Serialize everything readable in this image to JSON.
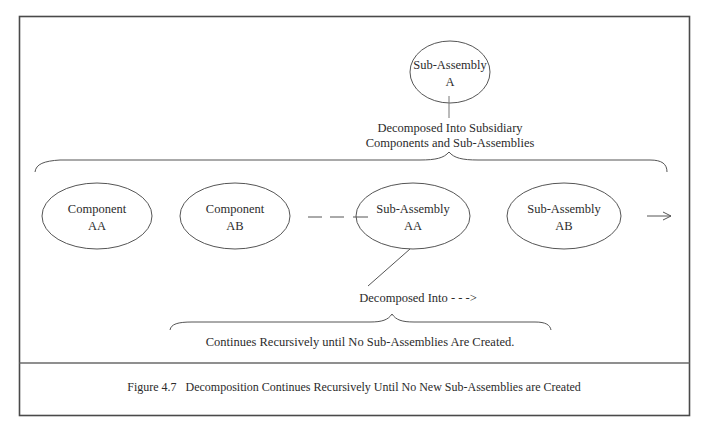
{
  "figure": {
    "caption": "Figure 4.7   Decomposition Continues Recursively Until No New Sub-Assemblies are Created",
    "colors": {
      "line": "#555555",
      "frame": "#4a4a4a",
      "text": "#2b2b2b",
      "background": "#ffffff"
    }
  },
  "diagram": {
    "root": {
      "line1": "Sub-Assembly",
      "line2": "A"
    },
    "top_note": {
      "line1": "Decomposed  Into Subsidiary",
      "line2": "Components and Sub-Assemblies"
    },
    "children": [
      {
        "line1": "Component",
        "line2": "AA",
        "kind": "component"
      },
      {
        "line1": "Component",
        "line2": "AB",
        "kind": "component"
      },
      {
        "line1": "Sub-Assembly",
        "line2": "AA",
        "kind": "sub-assembly"
      },
      {
        "line1": "Sub-Assembly",
        "line2": "AB",
        "kind": "sub-assembly"
      }
    ],
    "continuation_arrow": "-->",
    "ellipsis_dashes": "— — —",
    "bottom_note": "Decomposed  Into - - ->",
    "recursion_note": "Continues Recursively until No Sub-Assemblies Are Created."
  }
}
